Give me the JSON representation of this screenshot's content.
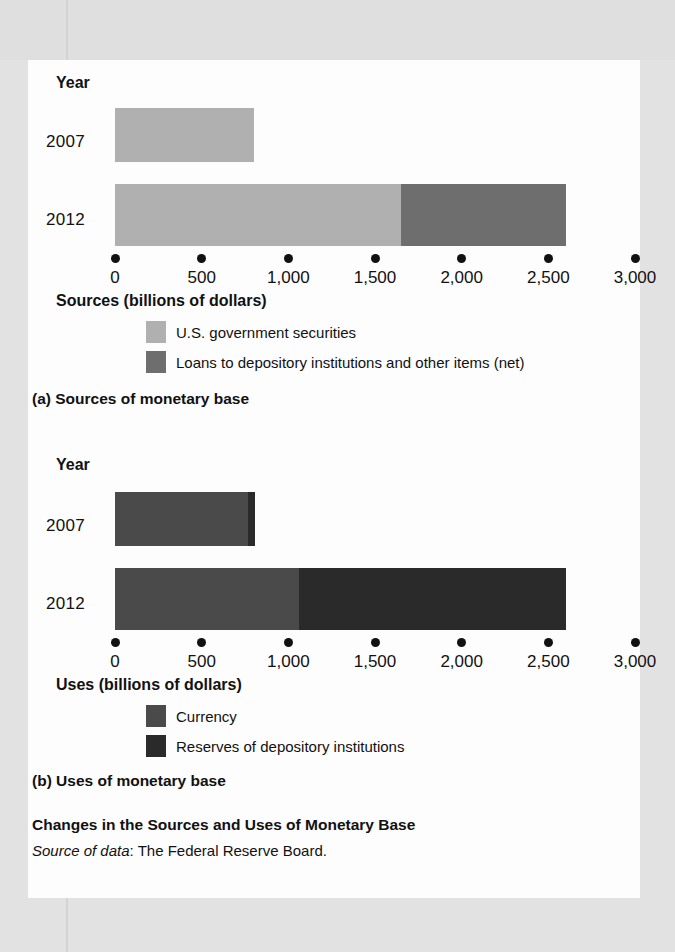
{
  "figure": {
    "title": "Changes in the Sources and Uses of Monetary Base",
    "source_prefix": "Source of data",
    "source_text": ": The Federal Reserve Board."
  },
  "panel_a": {
    "caption": "(a) Sources of monetary base",
    "year_header": "Year",
    "axis_title": "Sources (billions of dollars)",
    "legend": [
      {
        "label": "U.S. government securities",
        "color": "#b0b0b0"
      },
      {
        "label": "Loans to depository institutions and other items (net)",
        "color": "#6e6e6e"
      }
    ]
  },
  "panel_b": {
    "caption": "(b) Uses of monetary base",
    "year_header": "Year",
    "axis_title": "Uses (billions of dollars)",
    "legend": [
      {
        "label": "Currency",
        "color": "#4a4a4a"
      },
      {
        "label": "Reserves of depository institutions",
        "color": "#2a2a2a"
      }
    ]
  },
  "chart_data": [
    {
      "type": "bar",
      "orientation": "horizontal",
      "stacked": true,
      "title": "(a) Sources of monetary base",
      "xlabel": "Sources (billions of dollars)",
      "ylabel": "Year",
      "xlim": [
        0,
        3000
      ],
      "xticks": [
        0,
        500,
        1000,
        1500,
        2000,
        2500,
        3000
      ],
      "xticklabels": [
        "0",
        "500",
        "1,000",
        "1,500",
        "2,000",
        "2,500",
        "3,000"
      ],
      "categories": [
        "2007",
        "2012"
      ],
      "grid": false,
      "legend_position": "below-axis",
      "series": [
        {
          "name": "U.S. government securities",
          "color": "#b0b0b0",
          "values": [
            800,
            1650
          ]
        },
        {
          "name": "Loans to depository institutions and other items (net)",
          "color": "#6e6e6e",
          "values": [
            0,
            950
          ]
        }
      ],
      "totals": [
        800,
        2600
      ]
    },
    {
      "type": "bar",
      "orientation": "horizontal",
      "stacked": true,
      "title": "(b) Uses of monetary base",
      "xlabel": "Uses (billions of dollars)",
      "ylabel": "Year",
      "xlim": [
        0,
        3000
      ],
      "xticks": [
        0,
        500,
        1000,
        1500,
        2000,
        2500,
        3000
      ],
      "xticklabels": [
        "0",
        "500",
        "1,000",
        "1,500",
        "2,000",
        "2,500",
        "3,000"
      ],
      "categories": [
        "2007",
        "2012"
      ],
      "grid": false,
      "legend_position": "below-axis",
      "series": [
        {
          "name": "Currency",
          "color": "#4a4a4a",
          "values": [
            770,
            1060
          ]
        },
        {
          "name": "Reserves of depository institutions",
          "color": "#2a2a2a",
          "values": [
            40,
            1540
          ]
        }
      ],
      "totals": [
        810,
        2600
      ]
    }
  ]
}
